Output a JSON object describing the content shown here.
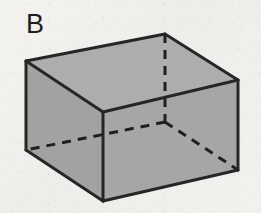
{
  "figure": {
    "label": "B",
    "shape_name": "rectangular-box",
    "projection": "oblique",
    "caption": "",
    "background_color": "#f2f0ec",
    "face_fill_color": "#a9a9a9",
    "face_fill_color_top": "#adadad",
    "face_fill_color_front": "#a6a6a6",
    "face_fill_color_left": "#a2a2a2",
    "edge_color": "#262626",
    "hidden_edge_color": "#1f1f1f",
    "edge_width": 3,
    "hidden_edge_width": 3,
    "hidden_edge_dash": "9 7",
    "vertices": {
      "top_left": [
        26,
        61
      ],
      "top_back": [
        165,
        34
      ],
      "top_right": [
        238,
        80
      ],
      "top_front": [
        103,
        112
      ],
      "bottom_left": [
        26,
        150
      ],
      "bottom_front": [
        103,
        201
      ],
      "bottom_right": [
        238,
        170
      ],
      "bottom_back": [
        165,
        122
      ]
    },
    "faces": [
      {
        "name": "top-face",
        "visible": true,
        "points": "26,61 165,34 238,80 103,112"
      },
      {
        "name": "left-face",
        "visible": true,
        "points": "26,61 103,112 103,201 26,150"
      },
      {
        "name": "front-right-face",
        "visible": true,
        "points": "103,112 238,80 238,170 103,201"
      }
    ],
    "visible_edges": [
      {
        "name": "edge-top-left-to-top-back",
        "points": "26,61 165,34"
      },
      {
        "name": "edge-top-back-to-top-right",
        "points": "165,34 238,80"
      },
      {
        "name": "edge-top-right-to-top-front",
        "points": "238,80 103,112"
      },
      {
        "name": "edge-top-front-to-top-left",
        "points": "103,112 26,61"
      },
      {
        "name": "edge-vertical-left",
        "points": "26,61 26,150"
      },
      {
        "name": "edge-vertical-front",
        "points": "103,112 103,201"
      },
      {
        "name": "edge-vertical-right",
        "points": "238,80 238,170"
      },
      {
        "name": "edge-bottom-left-to-front",
        "points": "26,150 103,201"
      },
      {
        "name": "edge-bottom-front-to-right",
        "points": "103,201 238,170"
      }
    ],
    "hidden_edges": [
      {
        "name": "hidden-edge-vertical-back",
        "points": "165,34 165,122"
      },
      {
        "name": "hidden-edge-bottom-back-to-left",
        "points": "165,122 26,150"
      },
      {
        "name": "hidden-edge-bottom-back-to-right",
        "points": "165,122 238,170"
      }
    ]
  }
}
